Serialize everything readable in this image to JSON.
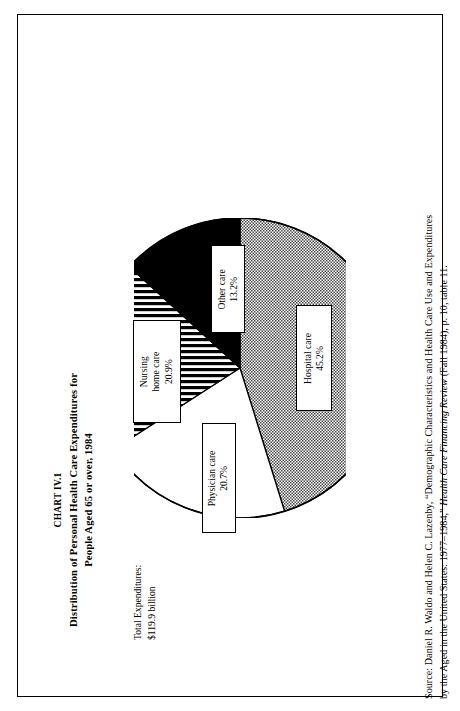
{
  "document": {
    "chart_number": "CHART IV.1",
    "title_line_1": "Distribution of Personal Health Care Expenditures for",
    "title_line_2": "People Aged 65 or over, 1984",
    "total_label": "Total Expenditures:",
    "total_value": "$119.9 billion",
    "source_line_1": "Source:  Daniel R. Waldo and Helen C. Lazenby, “Demographic Characteristics and Health Care Use and Expenditures",
    "source_line_2_a": "by the Aged in the United States: 1977–1984,” ",
    "source_line_2_italic": "Health Care Financing Review",
    "source_line_2_b": " (Fall 1984), p. 10, table 11."
  },
  "chart_data": {
    "type": "pie",
    "title": "Distribution of Personal Health Care Expenditures for People Aged 65 or over, 1984",
    "categories": [
      "Hospital care",
      "Nursing home care",
      "Physician care",
      "Other care"
    ],
    "values": [
      45.2,
      20.9,
      20.7,
      13.2
    ],
    "value_suffix": "%",
    "total": "$119.9 billion",
    "legend": "none",
    "grid": false,
    "slices": [
      {
        "label": "Hospital care",
        "value": 45.2,
        "value_text": "45.2%",
        "fill": "dotted-gray",
        "fill_color": "#8a8a8a",
        "start_deg": 0,
        "end_deg": 162.72
      },
      {
        "label": "Physician care",
        "value": 20.7,
        "value_text": "20.7%",
        "fill": "white",
        "fill_color": "#ffffff",
        "start_deg": 162.72,
        "end_deg": 237.24
      },
      {
        "label": "Nursing home care",
        "value": 20.9,
        "value_text": "20.9%",
        "fill": "horizontal-stripes",
        "fill_color": "#ffffff",
        "start_deg": 237.24,
        "end_deg": 312.48
      },
      {
        "label": "Other care",
        "value": 13.2,
        "value_text": "13.2%",
        "fill": "solid-black",
        "fill_color": "#000000",
        "start_deg": 312.48,
        "end_deg": 360
      }
    ]
  },
  "callouts": {
    "hospital": {
      "name": "Hospital care",
      "pct": "45.2%"
    },
    "other": {
      "name": "Other care",
      "pct": "13.2%"
    },
    "nursing_l1": "Nursing",
    "nursing_l2": "home care",
    "nursing_pct": "20.9%",
    "physician": {
      "name": "Physician care",
      "pct": "20.7%"
    }
  }
}
